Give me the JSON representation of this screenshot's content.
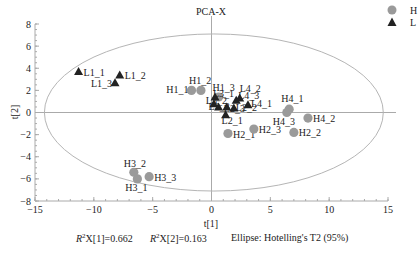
{
  "chart_data": {
    "type": "scatter",
    "title": "PCA-X",
    "xlabel": "t[1]",
    "ylabel": "t[2]",
    "xlim": [
      -15,
      15
    ],
    "ylim": [
      -8,
      8
    ],
    "xticks": [
      -15,
      -10,
      -5,
      0,
      5,
      10,
      15
    ],
    "yticks": [
      8,
      6,
      4,
      2,
      0,
      -2,
      -4,
      -6,
      -8
    ],
    "grid": false,
    "legend_position": "top-right",
    "ellipse": {
      "label": "Ellipse: Hotelling's T2 (95%)",
      "cx": 0.2,
      "cy": 0,
      "rx": 14.4,
      "ry": 7.1
    },
    "series": [
      {
        "name": "H",
        "marker": "circle",
        "color": "#9a9a9a",
        "points": [
          {
            "label": "H1_1",
            "x": -1.7,
            "y": 2.0
          },
          {
            "label": "H1_2",
            "x": -0.9,
            "y": 2.0
          },
          {
            "label": "H1_3",
            "x": 0.6,
            "y": 1.4
          },
          {
            "label": "H2_1",
            "x": 1.4,
            "y": -1.9
          },
          {
            "label": "H2_2",
            "x": 7.0,
            "y": -1.8
          },
          {
            "label": "H2_3",
            "x": 3.6,
            "y": -1.5
          },
          {
            "label": "H3_1",
            "x": -6.3,
            "y": -6.0
          },
          {
            "label": "H3_2",
            "x": -6.6,
            "y": -5.4
          },
          {
            "label": "H3_3",
            "x": -5.3,
            "y": -5.8
          },
          {
            "label": "H4_1",
            "x": 6.6,
            "y": 0.3
          },
          {
            "label": "H4_2",
            "x": 8.2,
            "y": -0.5
          },
          {
            "label": "H4_3",
            "x": 6.4,
            "y": 0.0
          }
        ]
      },
      {
        "name": "L",
        "marker": "triangle",
        "color": "#222222",
        "points": [
          {
            "label": "L1_1",
            "x": -11.3,
            "y": 3.7
          },
          {
            "label": "L1_2",
            "x": -7.8,
            "y": 3.4
          },
          {
            "label": "L1_3",
            "x": -8.2,
            "y": 2.7
          },
          {
            "label": "L2_1",
            "x": 1.2,
            "y": -0.2
          },
          {
            "label": "L2_2",
            "x": 1.9,
            "y": 0.4
          },
          {
            "label": "L2_3",
            "x": 1.3,
            "y": 0.5
          },
          {
            "label": "L3_1",
            "x": 0.3,
            "y": 1.4
          },
          {
            "label": "L3_2",
            "x": 0.2,
            "y": 0.8
          },
          {
            "label": "L3_3",
            "x": 0.6,
            "y": 0.5
          },
          {
            "label": "L4_1",
            "x": 3.1,
            "y": 0.7
          },
          {
            "label": "L4_2",
            "x": 2.4,
            "y": 1.3
          },
          {
            "label": "L4_3",
            "x": 2.1,
            "y": 1.1
          }
        ]
      }
    ],
    "annotations": [
      "R2X[1]=0.662",
      "R2X[2]=0.163",
      "Ellipse: Hotelling's T2 (95%)"
    ]
  },
  "footer": {
    "r2x1_prefix": "R",
    "r2x1_sup": "2",
    "r2x1_rest": "X[1]=0.662",
    "r2x2_prefix": "R",
    "r2x2_sup": "2",
    "r2x2_rest": "X[2]=0.163",
    "ellipse_label": "Ellipse: Hotelling's T2 (95%)"
  },
  "legend": [
    {
      "name": "H",
      "marker": "circle"
    },
    {
      "name": "L",
      "marker": "triangle"
    }
  ]
}
